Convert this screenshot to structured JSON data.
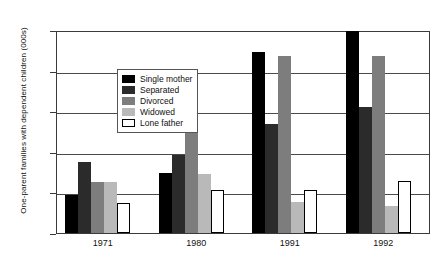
{
  "chart_data": {
    "type": "bar",
    "title": "",
    "xlabel": "",
    "ylabel": "One-parent families with dependent children (000s)",
    "categories": [
      "1971",
      "1980",
      "1991",
      "1992"
    ],
    "ylim": [
      0,
      500
    ],
    "yticks": [
      "0",
      "100",
      "200",
      "300",
      "400",
      "500"
    ],
    "grid": true,
    "legend_position": "top-left",
    "series": [
      {
        "name": "Single mother",
        "color": "#000000",
        "values": [
          93,
          147,
          445,
          498
        ]
      },
      {
        "name": "Separated",
        "color": "#2b2b2b",
        "values": [
          174,
          193,
          268,
          311
        ]
      },
      {
        "name": "Divorced",
        "color": "#7d7d7d",
        "values": [
          125,
          307,
          435,
          436
        ]
      },
      {
        "name": "Widowed",
        "color": "#b9b9b9",
        "values": [
          126,
          146,
          76,
          66
        ]
      },
      {
        "name": "Lone father",
        "color": "#ffffff",
        "values": [
          73,
          105,
          105,
          127
        ]
      }
    ]
  }
}
